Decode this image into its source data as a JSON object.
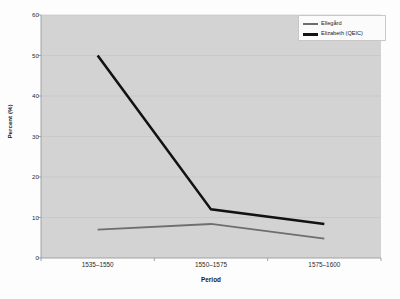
{
  "chart_data": {
    "type": "line",
    "title": "",
    "xlabel": "Period",
    "ylabel": "Percent (%)",
    "categories": [
      "1535–1550",
      "1550–1575",
      "1575–1600"
    ],
    "ylim": [
      0,
      60
    ],
    "yticks": [
      0,
      10,
      20,
      30,
      40,
      50,
      60
    ],
    "grid": true,
    "legend_position": "top-right",
    "series": [
      {
        "name": "Ellegård",
        "values": [
          7.0,
          8.4,
          4.8
        ],
        "color": "#6e6e6e",
        "width": 1.8
      },
      {
        "name": "Elizabeth (QEIC)",
        "values": [
          50.0,
          12.0,
          8.4
        ],
        "color": "#121212",
        "width": 2.6
      }
    ]
  },
  "style": {
    "plot_background": "#d3d3d3",
    "page_background": "#fdfdfd",
    "grid_color": "#c2c2c2",
    "axis_color": "#9a9a9a"
  }
}
